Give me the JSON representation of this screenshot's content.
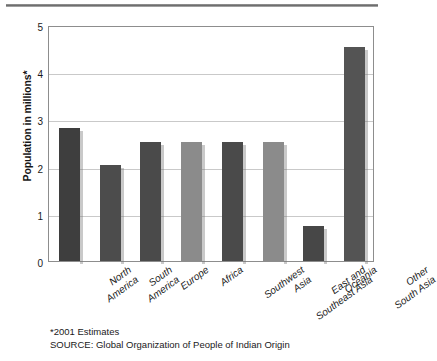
{
  "chart_data": {
    "type": "bar",
    "title": "",
    "xlabel": "",
    "ylabel": "Population in millions*",
    "ylim": [
      0,
      5
    ],
    "yticks": [
      "0",
      "1",
      "2",
      "3",
      "4",
      "5"
    ],
    "grid": true,
    "legend": "none",
    "categories": [
      "North America",
      "South America",
      "Europe",
      "Africa",
      "Southwest Asia",
      "East and Southeast Asia",
      "Oceania",
      "Other South Asia"
    ],
    "category_lines": [
      [
        "North",
        "America"
      ],
      [
        "South",
        "America"
      ],
      [
        "Europe",
        ""
      ],
      [
        "Africa",
        ""
      ],
      [
        "Southwest",
        "Asia"
      ],
      [
        "East and",
        "Southeast Asia"
      ],
      [
        "Oceania",
        ""
      ],
      [
        "Other",
        "South Asia"
      ]
    ],
    "values": [
      2.82,
      2.03,
      2.52,
      2.52,
      2.53,
      2.53,
      0.75,
      4.53
    ],
    "bar_colors": [
      "#3e3e3e",
      "#4c4c4c",
      "#4a4a4a",
      "#8b8b8b",
      "#4a4a4a",
      "#8b8b8b",
      "#474747",
      "#545454"
    ]
  },
  "footnotes": {
    "estimates": "*2001 Estimates",
    "source": "SOURCE: Global Organization of People of Indian Origin"
  },
  "colors": {
    "frame": "#8d8d8d",
    "grid": "#c9c9c9",
    "text": "#1a1a1a",
    "rule": "#6e6e6e"
  }
}
